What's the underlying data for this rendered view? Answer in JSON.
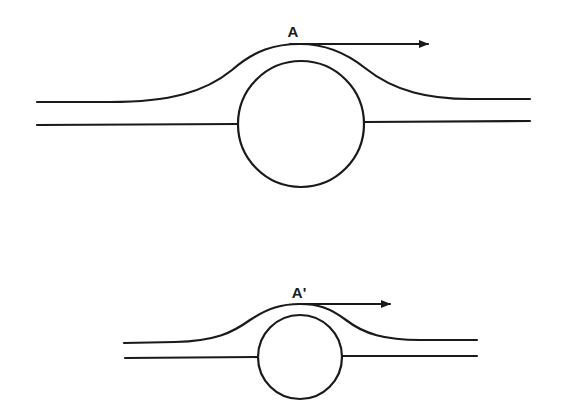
{
  "figure": {
    "top_panel": {
      "label": "A",
      "circle": {
        "cx": 301,
        "cy": 125,
        "r": 63
      },
      "arrow": {
        "x1": 290,
        "y1": 44,
        "x2": 428,
        "y2": 44
      }
    },
    "bottom_panel": {
      "label": "A'",
      "circle": {
        "cx": 300,
        "cy": 357,
        "r": 42
      },
      "arrow": {
        "x1": 298,
        "y1": 304,
        "x2": 390,
        "y2": 304
      }
    },
    "stroke_color": "#1a1a1a",
    "background": "#ffffff"
  }
}
